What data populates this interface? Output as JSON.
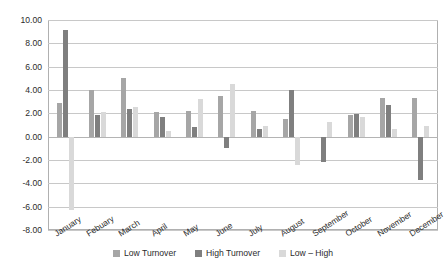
{
  "chart_data": {
    "type": "bar",
    "title": "",
    "subtitle": "",
    "xlabel": "",
    "ylabel": "",
    "ylim": [
      -8.0,
      10.0
    ],
    "ytick_step": 2.0,
    "ytick_labels": [
      "10.00",
      "8.00",
      "6.00",
      "4.00",
      "2.00",
      "0.00",
      "-2.00",
      "-4.00",
      "-6.00",
      "-8.00"
    ],
    "ytick_values": [
      10.0,
      8.0,
      6.0,
      4.0,
      2.0,
      0.0,
      -2.0,
      -4.0,
      -6.0,
      -8.0
    ],
    "grid": true,
    "legend_position": "bottom",
    "categories": [
      "January",
      "Febuary",
      "March",
      "April",
      "May",
      "June",
      "July",
      "August",
      "September",
      "October",
      "November",
      "December"
    ],
    "series": [
      {
        "name": "Low Turnover",
        "color": "#a6a6a6",
        "values": [
          2.85,
          4.0,
          5.05,
          2.15,
          2.2,
          3.45,
          2.2,
          1.55,
          0.0,
          1.85,
          3.3,
          3.35
        ]
      },
      {
        "name": "High Turnover",
        "color": "#7f7f7f",
        "values": [
          9.15,
          1.85,
          2.4,
          1.7,
          0.85,
          -0.95,
          0.7,
          4.0,
          -2.2,
          1.95,
          2.7,
          -3.75
        ]
      },
      {
        "name": "Low – High",
        "color": "#d9d9d9",
        "values": [
          -6.25,
          2.15,
          2.55,
          0.5,
          3.25,
          4.55,
          0.95,
          -2.4,
          1.25,
          1.7,
          0.7,
          0.95
        ]
      }
    ]
  },
  "legend": {
    "items": [
      {
        "label": "Low Turnover"
      },
      {
        "label": "High Turnover"
      },
      {
        "label": "Low – High"
      }
    ]
  }
}
